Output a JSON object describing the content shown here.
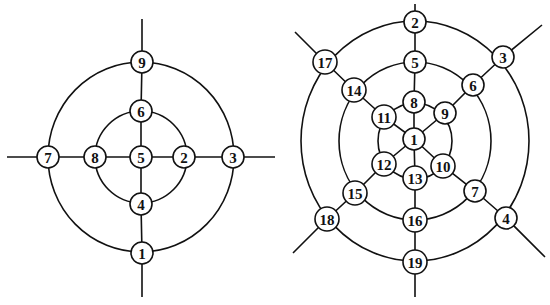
{
  "colors": {
    "stroke": "#111111",
    "node_fill": "#ffffff",
    "background": "#ffffff"
  },
  "diagrams": [
    {
      "id": "left-graph",
      "description": "Concentric two-ring graph with 9 numbered nodes on orthogonal spokes",
      "rings": [
        "inner",
        "outer"
      ],
      "nodes": [
        {
          "label": "1",
          "ring": "outer",
          "direction": "south"
        },
        {
          "label": "2",
          "ring": "inner",
          "direction": "east"
        },
        {
          "label": "3",
          "ring": "outer",
          "direction": "east"
        },
        {
          "label": "4",
          "ring": "inner",
          "direction": "south"
        },
        {
          "label": "5",
          "ring": "center",
          "direction": "center"
        },
        {
          "label": "6",
          "ring": "inner",
          "direction": "north"
        },
        {
          "label": "7",
          "ring": "outer",
          "direction": "west"
        },
        {
          "label": "8",
          "ring": "inner",
          "direction": "west"
        },
        {
          "label": "9",
          "ring": "outer",
          "direction": "north"
        }
      ],
      "spokes": [
        "north",
        "east",
        "south",
        "west"
      ]
    },
    {
      "id": "right-graph",
      "description": "Concentric three-ring graph with 19 numbered nodes on six spokes",
      "rings": [
        "inner",
        "middle",
        "outer"
      ],
      "nodes": [
        {
          "label": "1",
          "ring": "center",
          "direction": "center"
        },
        {
          "label": "2",
          "ring": "outer",
          "direction": "north"
        },
        {
          "label": "3",
          "ring": "outer",
          "direction": "north-east"
        },
        {
          "label": "4",
          "ring": "outer",
          "direction": "south-east"
        },
        {
          "label": "5",
          "ring": "middle",
          "direction": "north"
        },
        {
          "label": "6",
          "ring": "middle",
          "direction": "north-east"
        },
        {
          "label": "7",
          "ring": "middle",
          "direction": "south-east"
        },
        {
          "label": "8",
          "ring": "inner",
          "direction": "north"
        },
        {
          "label": "9",
          "ring": "inner",
          "direction": "north-east"
        },
        {
          "label": "10",
          "ring": "inner",
          "direction": "south-east"
        },
        {
          "label": "11",
          "ring": "inner",
          "direction": "north-west"
        },
        {
          "label": "12",
          "ring": "inner",
          "direction": "south-west"
        },
        {
          "label": "13",
          "ring": "inner",
          "direction": "south"
        },
        {
          "label": "14",
          "ring": "middle",
          "direction": "north-west"
        },
        {
          "label": "15",
          "ring": "middle",
          "direction": "south-west"
        },
        {
          "label": "16",
          "ring": "middle",
          "direction": "south"
        },
        {
          "label": "17",
          "ring": "outer",
          "direction": "north-west"
        },
        {
          "label": "18",
          "ring": "outer",
          "direction": "south-west"
        },
        {
          "label": "19",
          "ring": "outer",
          "direction": "south"
        }
      ],
      "spokes": [
        "north",
        "north-east",
        "south-east",
        "south",
        "south-west",
        "north-west"
      ]
    }
  ]
}
